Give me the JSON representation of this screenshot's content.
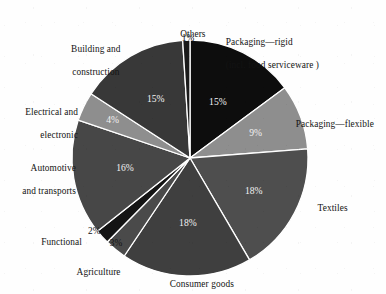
{
  "chart_data": {
    "type": "pie",
    "title": "",
    "subtitle": "",
    "xlabel": "",
    "ylabel": "",
    "legend_position": "outside-labels",
    "grid": false,
    "units": "percent",
    "start_angle_deg": 0,
    "direction": "clockwise",
    "categories": [
      "Packaging—rigid (incl. food serviceware )",
      "Packaging—flexible",
      "Textiles",
      "Consumer goods",
      "Agriculture",
      "Functional",
      "Automotive and transports",
      "Electrical and electronic",
      "Building and construction",
      "Others"
    ],
    "values": [
      15,
      9,
      18,
      18,
      3,
      2,
      16,
      4,
      15,
      1
    ],
    "data_labels": [
      "15%",
      "9%",
      "18%",
      "18%",
      "3%",
      "2%",
      "16%",
      "4%",
      "15%",
      "1%"
    ],
    "colors": [
      "#0d0d0d",
      "#8e8e8e",
      "#4e4e4e",
      "#3f3f3f",
      "#4a4a4a",
      "#141414",
      "#474747",
      "#8e8e8e",
      "#383838",
      "#1a1a1a"
    ],
    "slices": [
      {
        "label": "Packaging—rigid (incl. food serviceware )",
        "value": 15,
        "data_label": "15%",
        "color": "#0d0d0d",
        "label_placement": "outside-right"
      },
      {
        "label": "Packaging—flexible",
        "value": 9,
        "data_label": "9%",
        "color": "#8e8e8e",
        "label_placement": "outside-right"
      },
      {
        "label": "Textiles",
        "value": 18,
        "data_label": "18%",
        "color": "#4e4e4e",
        "label_placement": "outside-right"
      },
      {
        "label": "Consumer goods",
        "value": 18,
        "data_label": "18%",
        "color": "#3f3f3f",
        "label_placement": "outside-bottom"
      },
      {
        "label": "Agriculture",
        "value": 3,
        "data_label": "3%",
        "color": "#4a4a4a",
        "label_placement": "outside-bottom-left"
      },
      {
        "label": "Functional",
        "value": 2,
        "data_label": "2%",
        "color": "#141414",
        "label_placement": "outside-left"
      },
      {
        "label": "Automotive and transports",
        "value": 16,
        "data_label": "16%",
        "color": "#474747",
        "label_placement": "outside-left"
      },
      {
        "label": "Electrical and electronic",
        "value": 4,
        "data_label": "4%",
        "color": "#8e8e8e",
        "label_placement": "outside-left"
      },
      {
        "label": "Building and construction",
        "value": 15,
        "data_label": "15%",
        "color": "#383838",
        "label_placement": "outside-top-left"
      },
      {
        "label": "Others",
        "value": 1,
        "data_label": "1%",
        "color": "#1a1a1a",
        "label_placement": "outside-top"
      }
    ]
  },
  "labels": {
    "others": "Others",
    "others_pct": "1%",
    "packaging_rigid_line1": "Packaging—rigid",
    "packaging_rigid_line2": "(incl. food serviceware )",
    "packaging_flexible": "Packaging—flexible",
    "textiles": "Textiles",
    "consumer_goods": "Consumer goods",
    "agriculture": "Agriculture",
    "agriculture_pct": "3%",
    "functional": "Functional",
    "functional_pct": "2%",
    "automotive_line1": "Automotive",
    "automotive_line2": "and transports",
    "electrical_line1": "Electrical and",
    "electrical_line2": "electronic",
    "building_line1": "Building and",
    "building_line2": "construction"
  },
  "inside_labels": {
    "rigid": "15%",
    "flexible": "9%",
    "textiles": "18%",
    "consumer": "18%",
    "automotive": "16%",
    "electrical": "4%",
    "building": "15%"
  },
  "style": {
    "background": "#fefefe",
    "separator": "#ffffff",
    "text": "#131313",
    "inside_text": "#f2f2f2"
  }
}
